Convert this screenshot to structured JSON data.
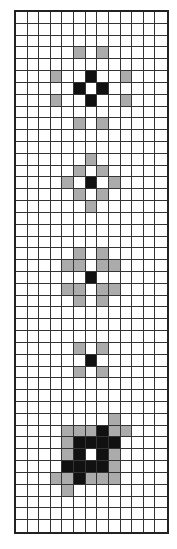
{
  "diagram": {
    "type": "cell-grid",
    "columns": 13,
    "rows": 44,
    "legend": {
      "empty": "white",
      "shaded": "gray-stippled",
      "dark": "black"
    },
    "colors": {
      "empty": "#ffffff",
      "shaded": "#c8c8c8",
      "dark": "#111111",
      "gridline": "#333333"
    },
    "clusters": [
      {
        "name": "cluster-1",
        "cells": [
          {
            "row": 3,
            "col": 5,
            "state": "shaded"
          },
          {
            "row": 3,
            "col": 7,
            "state": "shaded"
          },
          {
            "row": 5,
            "col": 3,
            "state": "shaded"
          },
          {
            "row": 5,
            "col": 6,
            "state": "dark"
          },
          {
            "row": 5,
            "col": 9,
            "state": "shaded"
          },
          {
            "row": 6,
            "col": 5,
            "state": "dark"
          },
          {
            "row": 6,
            "col": 7,
            "state": "dark"
          },
          {
            "row": 7,
            "col": 3,
            "state": "shaded"
          },
          {
            "row": 7,
            "col": 6,
            "state": "dark"
          },
          {
            "row": 7,
            "col": 9,
            "state": "shaded"
          },
          {
            "row": 9,
            "col": 5,
            "state": "shaded"
          },
          {
            "row": 9,
            "col": 7,
            "state": "shaded"
          }
        ]
      },
      {
        "name": "cluster-2",
        "cells": [
          {
            "row": 12,
            "col": 6,
            "state": "shaded"
          },
          {
            "row": 13,
            "col": 5,
            "state": "shaded"
          },
          {
            "row": 13,
            "col": 7,
            "state": "shaded"
          },
          {
            "row": 14,
            "col": 4,
            "state": "shaded"
          },
          {
            "row": 14,
            "col": 6,
            "state": "dark"
          },
          {
            "row": 14,
            "col": 8,
            "state": "shaded"
          },
          {
            "row": 15,
            "col": 5,
            "state": "shaded"
          },
          {
            "row": 15,
            "col": 7,
            "state": "shaded"
          },
          {
            "row": 16,
            "col": 6,
            "state": "shaded"
          }
        ]
      },
      {
        "name": "cluster-3",
        "cells": [
          {
            "row": 20,
            "col": 5,
            "state": "shaded"
          },
          {
            "row": 20,
            "col": 7,
            "state": "shaded"
          },
          {
            "row": 21,
            "col": 4,
            "state": "shaded"
          },
          {
            "row": 21,
            "col": 5,
            "state": "shaded"
          },
          {
            "row": 21,
            "col": 7,
            "state": "shaded"
          },
          {
            "row": 21,
            "col": 8,
            "state": "shaded"
          },
          {
            "row": 22,
            "col": 6,
            "state": "dark"
          },
          {
            "row": 23,
            "col": 4,
            "state": "shaded"
          },
          {
            "row": 23,
            "col": 5,
            "state": "shaded"
          },
          {
            "row": 23,
            "col": 7,
            "state": "shaded"
          },
          {
            "row": 23,
            "col": 8,
            "state": "shaded"
          },
          {
            "row": 24,
            "col": 5,
            "state": "shaded"
          },
          {
            "row": 24,
            "col": 7,
            "state": "shaded"
          }
        ]
      },
      {
        "name": "cluster-4",
        "cells": [
          {
            "row": 28,
            "col": 5,
            "state": "shaded"
          },
          {
            "row": 28,
            "col": 7,
            "state": "shaded"
          },
          {
            "row": 29,
            "col": 6,
            "state": "dark"
          },
          {
            "row": 30,
            "col": 5,
            "state": "shaded"
          },
          {
            "row": 30,
            "col": 7,
            "state": "shaded"
          }
        ]
      },
      {
        "name": "cluster-5",
        "cells": [
          {
            "row": 34,
            "col": 8,
            "state": "shaded"
          },
          {
            "row": 35,
            "col": 4,
            "state": "shaded"
          },
          {
            "row": 35,
            "col": 5,
            "state": "shaded"
          },
          {
            "row": 35,
            "col": 6,
            "state": "shaded"
          },
          {
            "row": 35,
            "col": 7,
            "state": "dark"
          },
          {
            "row": 35,
            "col": 8,
            "state": "shaded"
          },
          {
            "row": 35,
            "col": 9,
            "state": "shaded"
          },
          {
            "row": 36,
            "col": 4,
            "state": "shaded"
          },
          {
            "row": 36,
            "col": 5,
            "state": "dark"
          },
          {
            "row": 36,
            "col": 6,
            "state": "dark"
          },
          {
            "row": 36,
            "col": 7,
            "state": "dark"
          },
          {
            "row": 36,
            "col": 8,
            "state": "dark"
          },
          {
            "row": 37,
            "col": 4,
            "state": "shaded"
          },
          {
            "row": 37,
            "col": 5,
            "state": "dark"
          },
          {
            "row": 37,
            "col": 7,
            "state": "dark"
          },
          {
            "row": 37,
            "col": 8,
            "state": "shaded"
          },
          {
            "row": 38,
            "col": 4,
            "state": "dark"
          },
          {
            "row": 38,
            "col": 5,
            "state": "dark"
          },
          {
            "row": 38,
            "col": 6,
            "state": "dark"
          },
          {
            "row": 38,
            "col": 7,
            "state": "dark"
          },
          {
            "row": 38,
            "col": 8,
            "state": "shaded"
          },
          {
            "row": 39,
            "col": 3,
            "state": "shaded"
          },
          {
            "row": 39,
            "col": 4,
            "state": "shaded"
          },
          {
            "row": 39,
            "col": 5,
            "state": "dark"
          },
          {
            "row": 39,
            "col": 6,
            "state": "shaded"
          },
          {
            "row": 39,
            "col": 7,
            "state": "shaded"
          },
          {
            "row": 39,
            "col": 8,
            "state": "shaded"
          },
          {
            "row": 40,
            "col": 4,
            "state": "shaded"
          }
        ]
      }
    ]
  }
}
